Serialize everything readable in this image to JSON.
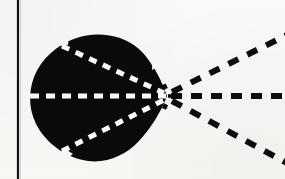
{
  "figure": {
    "title": "Radiation lobe diagram",
    "description": "Scanned monochrome technical figure: a solid black teardrop-shaped lobe with white dashed rays converging to a point at its right tip, and black dashed rays continuing outward to the right.",
    "background_color": "#f9f9f7",
    "ink_color": "#0a0a0a",
    "paper_color": "#fdfdfb",
    "canvas": {
      "width": 285,
      "height": 179
    }
  },
  "border_rule": {
    "name": "left vertical rule",
    "orientation": "vertical",
    "x": 18,
    "y_start": 0,
    "y_end": 179,
    "thickness": 2.2,
    "color": "#111111"
  },
  "lobe": {
    "name": "solid black lobe",
    "fill": "#0a0a0a",
    "apex": {
      "x": 167,
      "y": 96
    },
    "extent": {
      "left": 30,
      "right": 167,
      "top": 37,
      "bottom": 161
    },
    "path": "M 167 96 C 163 84 157 72 150 62 C 142 50 131 41 117 37 C 100 32 82 34 67 42 C 49 52 36 69 31 88 C 26 107 31 127 44 141 C 57 156 77 163 96 161 C 115 159 132 148 145 133 C 156 120 163 108 167 96 Z"
  },
  "rays": [
    {
      "name": "axis ray",
      "label": "central axis",
      "angle_deg": 0,
      "inner": {
        "color": "#ffffff",
        "from": {
          "x": 31,
          "y": 96
        },
        "to": {
          "x": 166,
          "y": 96
        },
        "dash": "9 7",
        "width": 5
      },
      "outer": {
        "color": "#0d0d0d",
        "from": {
          "x": 170,
          "y": 96
        },
        "to": {
          "x": 285,
          "y": 96
        },
        "dash": "11 9",
        "width": 6
      }
    },
    {
      "name": "upper ray",
      "label": "upper lobe boundary",
      "angle_deg": 26,
      "inner": {
        "color": "#ffffff",
        "from": {
          "x": 63,
          "y": 47
        },
        "to": {
          "x": 164,
          "y": 93
        },
        "dash": "8 7",
        "width": 5
      },
      "outer": {
        "color": "#0d0d0d",
        "from": {
          "x": 172,
          "y": 92
        },
        "to": {
          "x": 285,
          "y": 36
        },
        "dash": "11 10",
        "width": 6
      }
    },
    {
      "name": "lower ray",
      "label": "lower lobe boundary",
      "angle_deg": -28,
      "inner": {
        "color": "#ffffff",
        "from": {
          "x": 63,
          "y": 150
        },
        "to": {
          "x": 164,
          "y": 100
        },
        "dash": "8 7",
        "width": 5
      },
      "outer": {
        "color": "#0d0d0d",
        "from": {
          "x": 172,
          "y": 101
        },
        "to": {
          "x": 285,
          "y": 162
        },
        "dash": "11 10",
        "width": 6
      }
    }
  ],
  "convergence_point": {
    "name": "focus point",
    "x": 167,
    "y": 96,
    "marker": "ray convergence / focus"
  },
  "notches": [
    {
      "name": "top-left notch",
      "x": 62,
      "y": 41
    },
    {
      "name": "bottom-left notch",
      "x": 67,
      "y": 152
    }
  ]
}
